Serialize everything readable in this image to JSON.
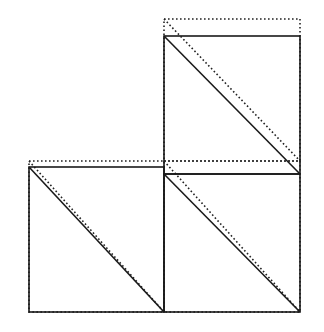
{
  "diagram": {
    "colors": {
      "stroke": "#1a1a1a",
      "background": "#ffffff"
    },
    "squares": [
      {
        "id": "top-right",
        "solid": {
          "x1": 164,
          "y1": 36,
          "x2": 300,
          "y2": 174
        },
        "dotted": {
          "x1": 164,
          "y1": 19,
          "x2": 300,
          "y2": 161
        }
      },
      {
        "id": "bottom-left",
        "solid": {
          "x1": 29,
          "y1": 167,
          "x2": 164,
          "y2": 312
        },
        "dotted": {
          "x1": 29,
          "y1": 161,
          "x2": 164,
          "y2": 312
        }
      },
      {
        "id": "bottom-right",
        "solid": {
          "x1": 164,
          "y1": 174,
          "x2": 300,
          "y2": 312
        },
        "dotted": {
          "x1": 164,
          "y1": 161,
          "x2": 300,
          "y2": 312
        }
      }
    ]
  }
}
